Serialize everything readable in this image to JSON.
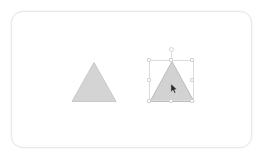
{
  "app": {
    "title": "Shape Editor Canvas",
    "background_color": "#ffffff"
  },
  "canvas": {
    "name": "drawing-canvas",
    "background_color": "#ffffff",
    "border_color": "#e9e9e9",
    "corner_radius": "12px",
    "x": 11,
    "y": 11,
    "width": 241,
    "height": 137
  },
  "shapes": [
    {
      "id": "triangle-1",
      "type": "triangle",
      "label": "Triangle",
      "selected": false,
      "fill_color": "#d4d4d4",
      "stroke_color": "#c9c9c9",
      "x": 72,
      "y": 62,
      "width": 44,
      "height": 39
    },
    {
      "id": "triangle-2",
      "type": "triangle",
      "label": "Triangle",
      "selected": true,
      "fill_color": "#d2d2d2",
      "stroke_color": "#bdbdbd",
      "x": 150,
      "y": 61,
      "width": 44,
      "height": 40
    }
  ],
  "selection": {
    "name": "selection-bounding-box",
    "target_shape": "triangle-2",
    "box_color": "#dcdcdc",
    "handle_fill": "#ffffff",
    "handle_border": "#d0d0d0",
    "x": 149,
    "y": 60,
    "width": 45,
    "height": 41,
    "rotation_handle": {
      "label": "rotate-handle",
      "x": 171,
      "y": 49
    },
    "handles": [
      {
        "label": "top-left-handle",
        "position": "nw"
      },
      {
        "label": "top-center-handle",
        "position": "n"
      },
      {
        "label": "top-right-handle",
        "position": "ne"
      },
      {
        "label": "middle-left-handle",
        "position": "w"
      },
      {
        "label": "middle-right-handle",
        "position": "e"
      },
      {
        "label": "bottom-left-handle",
        "position": "sw"
      },
      {
        "label": "bottom-center-handle",
        "position": "s"
      },
      {
        "label": "bottom-right-handle",
        "position": "se"
      }
    ]
  },
  "cursor": {
    "name": "mouse-pointer",
    "type": "arrow",
    "color": "#2b2b2b",
    "x": 170,
    "y": 83
  }
}
